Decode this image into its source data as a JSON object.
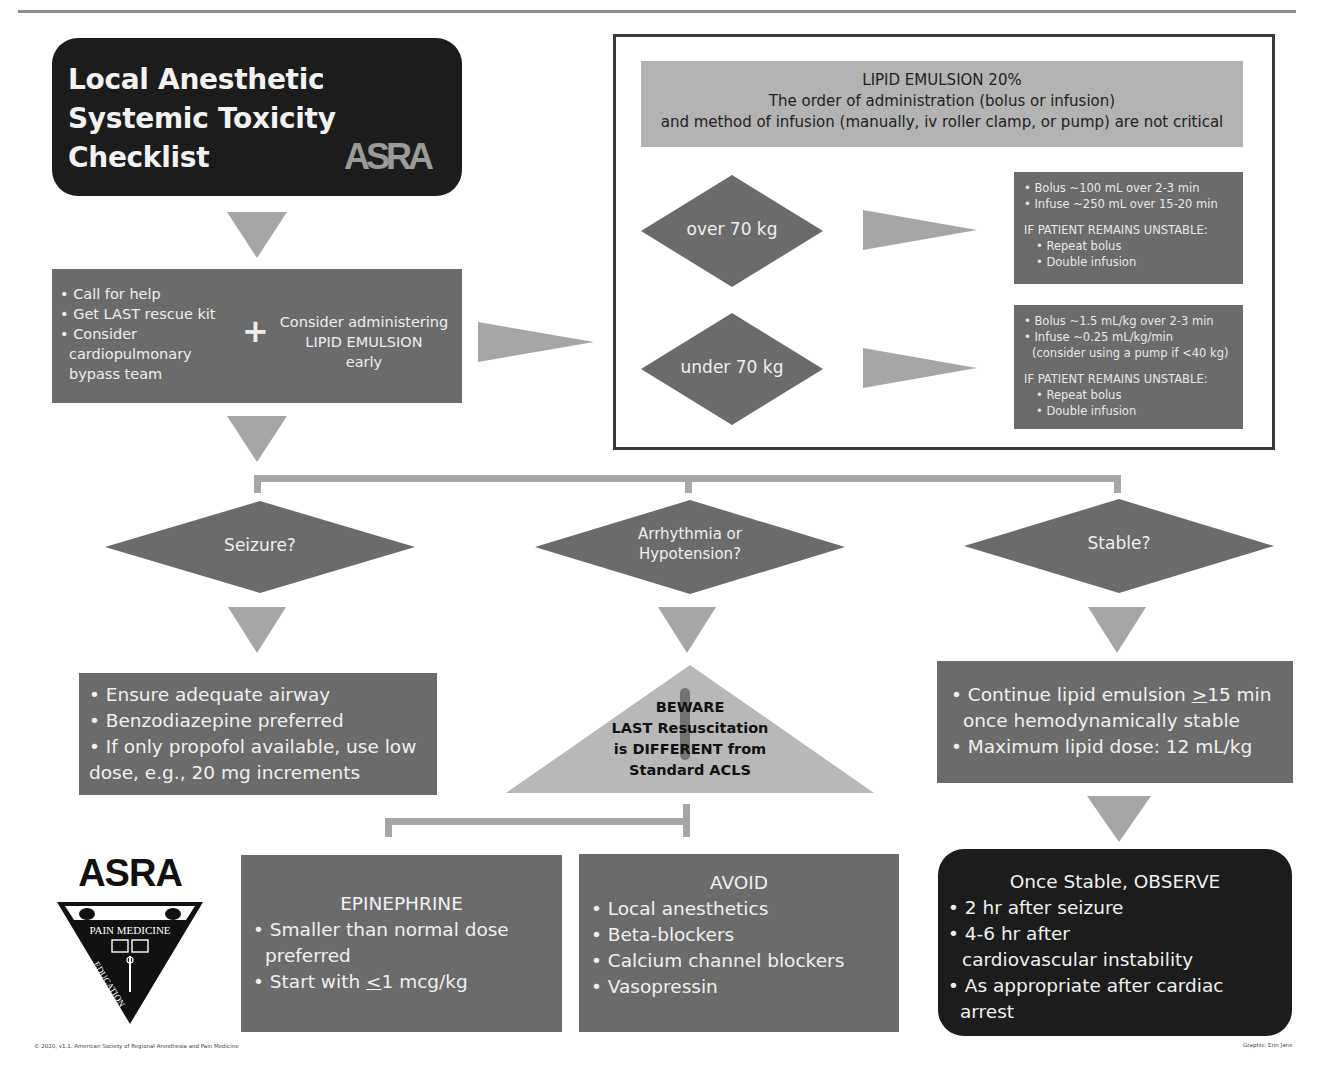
{
  "title": {
    "lines": [
      "Local Anesthetic",
      "Systemic Toxicity",
      "Checklist"
    ],
    "logo_text": "ASRA"
  },
  "step1": {
    "items": [
      "Call for help",
      "Get LAST rescue kit",
      "Consider cardiopulmonary bypass team"
    ],
    "plus": "+",
    "consider": [
      "Consider administering",
      "LIPID EMULSION",
      "early"
    ]
  },
  "lipid": {
    "header": [
      "LIPID EMULSION 20%",
      "The order of administration (bolus or infusion)",
      "and method of infusion (manually, iv roller clamp, or pump) are not critical"
    ],
    "over": {
      "label": "over 70 kg",
      "doses": [
        "Bolus ~100 mL over 2-3 min",
        "Infuse ~250 mL over 15-20 min"
      ],
      "unstable_heading": "IF PATIENT REMAINS UNSTABLE:",
      "unstable_items": [
        "Repeat bolus",
        "Double infusion"
      ]
    },
    "under": {
      "label": "under 70 kg",
      "doses": [
        "Bolus ~1.5 mL/kg over 2-3 min",
        "Infuse ~0.25 mL/kg/min",
        "(consider using a pump if <40 kg)"
      ],
      "unstable_heading": "IF PATIENT REMAINS UNSTABLE:",
      "unstable_items": [
        "Repeat bolus",
        "Double infusion"
      ]
    }
  },
  "decisions": {
    "seizure": "Seizure?",
    "arrhythmia": [
      "Arrhythmia or",
      "Hypotension?"
    ],
    "stable": "Stable?"
  },
  "seizure_box": {
    "items": [
      "Ensure adequate airway",
      "Benzodiazepine preferred",
      "If only propofol available, use low",
      "dose, e.g., 20 mg increments"
    ]
  },
  "beware": {
    "lines": [
      "BEWARE",
      "LAST Resuscitation",
      "is DIFFERENT from",
      "Standard ACLS"
    ]
  },
  "stable_box": {
    "item1_pre": "Continue lipid emulsion ",
    "item1_sym": ">",
    "item1_post": "15 min",
    "item1_cont": "once hemodynamically stable",
    "item2": "Maximum lipid dose: 12 mL/kg"
  },
  "epinephrine": {
    "title": "EPINEPHRINE",
    "item1": "Smaller than normal dose",
    "item1_cont": "preferred",
    "item2_pre": "Start with ",
    "item2_sym": "<",
    "item2_post": "1 mcg/kg"
  },
  "avoid": {
    "title": "AVOID",
    "items": [
      "Local anesthetics",
      "Beta-blockers",
      "Calcium channel blockers",
      "Vasopressin"
    ]
  },
  "observe": {
    "title": "Once Stable, OBSERVE",
    "items": [
      "2 hr after seizure",
      "4-6 hr after",
      "As appropriate after cardiac arrest"
    ],
    "item2_cont": "cardiovascular instability"
  },
  "asra_logo": {
    "name": "ASRA",
    "banner": "PAIN MEDICINE",
    "left": "EDUCATION",
    "right": "RESEARCH"
  },
  "footer": {
    "copyright": "© 2020, v1.1. American Society of Regional Anesthesia and Pain Medicine",
    "credit": "Graphic: Erin Janx"
  },
  "colors": {
    "dark_gray": "#6b6b6b",
    "black": "#1c1c1c",
    "light_gray": "#b3b3b3",
    "arrow_gray": "#a6a6a6"
  }
}
